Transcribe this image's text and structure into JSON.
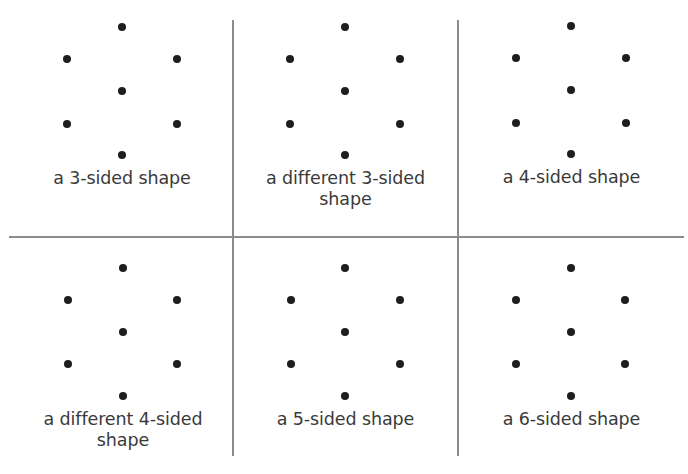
{
  "worksheet": {
    "grid": {
      "line_color": "#8c8c8c",
      "dot_color": "#1e1e1e",
      "text_color": "#3a3a3a"
    },
    "cells": [
      {
        "label": "a 3-sided shape"
      },
      {
        "label_line1": "a different 3-sided",
        "label_line2": "shape"
      },
      {
        "label": "a 4-sided shape"
      },
      {
        "label_line1": "a different 4-sided",
        "label_line2": "shape"
      },
      {
        "label": "a 5-sided shape"
      },
      {
        "label": "a 6-sided shape"
      }
    ],
    "dot_pattern": {
      "description": "7-dot hexagonal arrangement with center dot",
      "count": 7
    }
  }
}
